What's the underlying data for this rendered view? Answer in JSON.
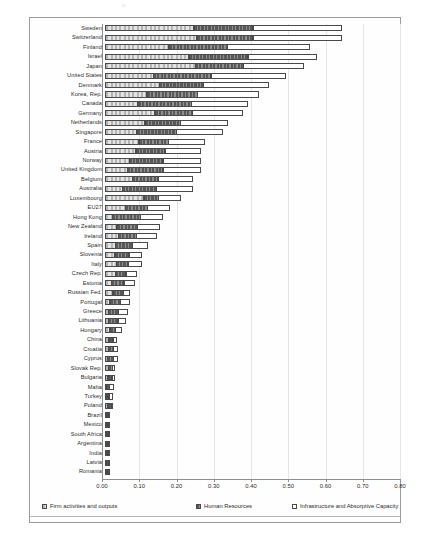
{
  "chart_data": {
    "type": "bar",
    "orientation": "horizontal",
    "stacked": true,
    "title": "",
    "subtitle": "",
    "xlabel": "",
    "ylabel": "",
    "xlim": [
      0.0,
      0.8
    ],
    "xticks": [
      "0.00",
      "0.10",
      "0.20",
      "0.30",
      "0.40",
      "0.50",
      "0.60",
      "0.70",
      "0.80"
    ],
    "xtick_values": [
      0.0,
      0.1,
      0.2,
      0.3,
      0.4,
      0.5,
      0.6,
      0.7,
      0.8
    ],
    "grid": true,
    "legend_position": "bottom",
    "legend": [
      "Firm activities and outputs",
      "Human Resources",
      "Infrastructure and Absorptive Capacity"
    ],
    "categories": [
      "Sweden",
      "Switzerland",
      "Finland",
      "Israel",
      "Japan",
      "United States",
      "Denmark",
      "Korea, Rep.",
      "Canada",
      "Germany",
      "Netherlands",
      "Singapore",
      "France",
      "Austria",
      "Norway",
      "United Kingdom",
      "Belgium",
      "Australia",
      "Luxembourg",
      "EU27",
      "Hong Kong",
      "New Zealand",
      "Ireland",
      "Spain",
      "Slovenia",
      "Italy",
      "Czech Rep.",
      "Estonia",
      "Russian Fed.",
      "Portugal",
      "Greece",
      "Lithuania",
      "Hungary",
      "China",
      "Croatia",
      "Cyprus",
      "Slovak Rep.",
      "Bulgaria",
      "Malta",
      "Turkey",
      "Poland",
      "Brazil",
      "Mexico",
      "South Africa",
      "Argentina",
      "India",
      "Latvia",
      "Romania"
    ],
    "series": [
      {
        "name": "Firm activities and outputs",
        "values": [
          0.27,
          0.28,
          0.21,
          0.27,
          0.3,
          0.17,
          0.2,
          0.16,
          0.13,
          0.2,
          0.17,
          0.14,
          0.16,
          0.15,
          0.12,
          0.11,
          0.14,
          0.09,
          0.21,
          0.12,
          0.05,
          0.08,
          0.09,
          0.08,
          0.08,
          0.09,
          0.09,
          0.06,
          0.08,
          0.05,
          0.04,
          0.04,
          0.06,
          0.06,
          0.05,
          0.04,
          0.06,
          0.05,
          0.03,
          0.04,
          0.06,
          0.03,
          0.05,
          0.05,
          0.05,
          0.04,
          0.04,
          0.05
        ]
      },
      {
        "name": "Human Resources",
        "values": [
          0.18,
          0.17,
          0.19,
          0.19,
          0.16,
          0.2,
          0.16,
          0.19,
          0.21,
          0.15,
          0.15,
          0.17,
          0.14,
          0.14,
          0.16,
          0.17,
          0.13,
          0.17,
          0.08,
          0.13,
          0.17,
          0.13,
          0.12,
          0.12,
          0.11,
          0.09,
          0.09,
          0.11,
          0.1,
          0.1,
          0.1,
          0.1,
          0.07,
          0.06,
          0.07,
          0.08,
          0.06,
          0.06,
          0.05,
          0.04,
          0.06,
          0.04,
          0.04,
          0.04,
          0.04,
          0.04,
          0.05,
          0.04
        ]
      },
      {
        "name": "Infrastructure and Absorptive Capacity",
        "values": [
          0.27,
          0.27,
          0.27,
          0.22,
          0.2,
          0.26,
          0.24,
          0.23,
          0.22,
          0.2,
          0.2,
          0.2,
          0.17,
          0.17,
          0.18,
          0.18,
          0.17,
          0.18,
          0.12,
          0.13,
          0.14,
          0.14,
          0.13,
          0.11,
          0.1,
          0.11,
          0.09,
          0.09,
          0.06,
          0.09,
          0.09,
          0.08,
          0.07,
          0.05,
          0.06,
          0.06,
          0.04,
          0.05,
          0.07,
          0.06,
          0.02,
          0.05,
          0.03,
          0.02,
          0.02,
          0.02,
          0.02,
          0.02
        ]
      }
    ],
    "colors": {
      "series_0": "#c8c8c8",
      "series_1": "#6e6e6e",
      "series_2": "#ffffff",
      "outline": "#4a4a4a",
      "gridline": "#e6e6e6",
      "axis": "#8d8d8d",
      "text": "#2b2b2b"
    }
  }
}
